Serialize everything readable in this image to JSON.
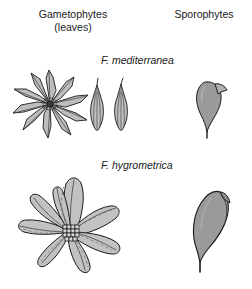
{
  "figure": {
    "background_color": "#ffffff",
    "headers": {
      "gametophytes": "Gametophytes\n(leaves)",
      "sporophytes": "Sporophytes"
    },
    "species": [
      {
        "name": "F. mediterranea",
        "row": "top",
        "gametophyte": {
          "form": "star-shaped rosette",
          "leaf_count": 10,
          "leaf_shape": "narrow lanceolate, long-acuminate",
          "detached_leaf_count": 2,
          "detached_leaf_shape": "oblong with long fine hair-point (awn)"
        },
        "sporophyte": {
          "form": "pyriform capsule with oblique beaked operculum",
          "relative_size": "small"
        }
      },
      {
        "name": "F. hygrometrica",
        "row": "bottom",
        "gametophyte": {
          "form": "broad rosette",
          "leaf_count": 8,
          "leaf_shape": "broadly obovate, concave, short-pointed",
          "center_detail": "grid of small central cells",
          "detached_leaf_count": 0
        },
        "sporophyte": {
          "form": "large asymmetric pyriform capsule, curved and beaked",
          "relative_size": "large"
        }
      }
    ],
    "colors": {
      "outline": "#1a1a1a",
      "leaf_fill": "#b8b8b8",
      "leaf_fill_light": "#c9c9c9",
      "capsule_fill": "#9a9a9a",
      "vein": "#4a4a4a",
      "text": "#1a1a1a"
    }
  }
}
